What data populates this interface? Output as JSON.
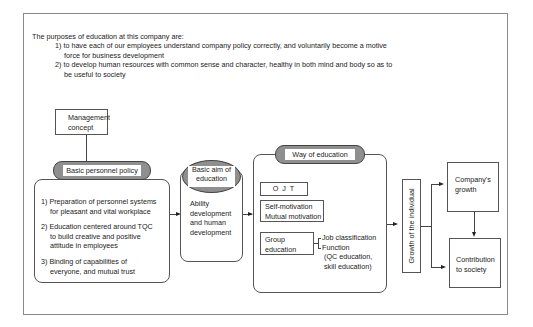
{
  "intro": {
    "heading": "The purposes of education at this company are:",
    "purposes": [
      {
        "line1": "1) to have each of our employees understand company policy correctly, and voluntarily become a motive",
        "line2": "force for business development"
      },
      {
        "line1": "2) to develop human resources with common sense and character, healthy in both mind and body so as to",
        "line2": "be useful to society"
      }
    ]
  },
  "diagram": {
    "management_concept": {
      "line1": "Management",
      "line2": "concept"
    },
    "personnel_policy": {
      "title": "Basic personnel policy",
      "items": [
        {
          "line1": "1) Preparation of personnel systems",
          "line2": "for pleasant and vital workplace"
        },
        {
          "line1": "2) Education centered around TQC",
          "line2": "to build creative and positive",
          "line3": "attitude in employees"
        },
        {
          "line1": "3) Binding of capabilities of",
          "line2": "everyone, and mutual trust"
        }
      ]
    },
    "basic_aim": {
      "title_line1": "Basic aim of",
      "title_line2": "education",
      "body": [
        "Ability",
        "development",
        "and human",
        "development"
      ]
    },
    "way_of_education": {
      "title": "Way of education",
      "ojt": "O J T",
      "motivation": {
        "line1": "Self-motivation",
        "line2": "Mutual motivation"
      },
      "group": {
        "line1": "Group",
        "line2": "education"
      },
      "group_detail": [
        "Job classification",
        "Function",
        "(QC education,",
        "skill education)"
      ]
    },
    "growth_individual": "Growth of the individual",
    "company_growth": {
      "line1": "Company's",
      "line2": "growth"
    },
    "contribution": {
      "line1": "Contribution",
      "line2": "to society"
    }
  }
}
